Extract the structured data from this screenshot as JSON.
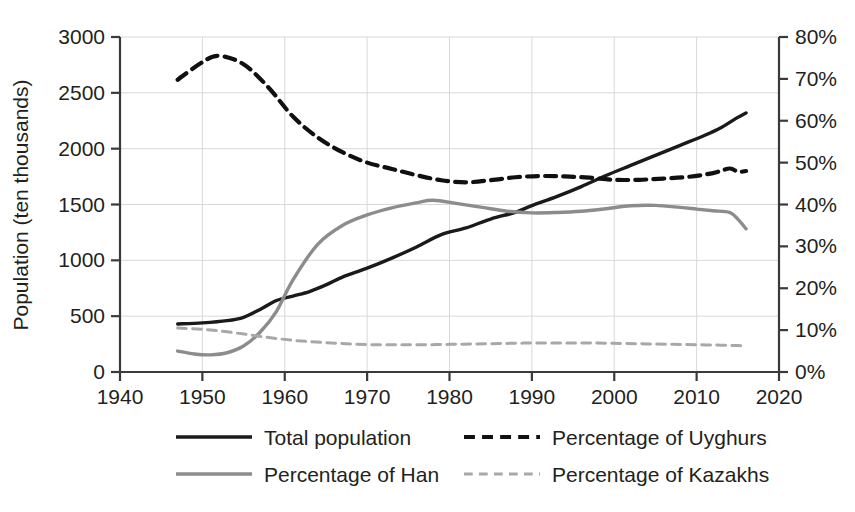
{
  "chart_data": {
    "type": "line",
    "title": "",
    "xlabel": "",
    "ylabel": "Population (ten thousands)",
    "y2label": "",
    "xlim": [
      1940,
      2020
    ],
    "ylim": [
      0,
      3000
    ],
    "y2lim": [
      0,
      80
    ],
    "grid": true,
    "legend_position": "bottom",
    "x_ticks": [
      "1940",
      "1950",
      "1960",
      "1970",
      "1980",
      "1990",
      "2000",
      "2010",
      "2020"
    ],
    "y_ticks": [
      "0",
      "500",
      "1000",
      "1500",
      "2000",
      "2500",
      "3000"
    ],
    "y2_ticks": [
      "0%",
      "10%",
      "20%",
      "30%",
      "40%",
      "50%",
      "60%",
      "70%",
      "80%"
    ],
    "series": [
      {
        "name": "Total population",
        "axis": "left",
        "style": "solid",
        "color": "#1a1a1a",
        "width": 3.4,
        "x": [
          1947,
          1950,
          1953,
          1955,
          1957,
          1959,
          1961,
          1963,
          1965,
          1967,
          1970,
          1973,
          1976,
          1979,
          1982,
          1985,
          1988,
          1990,
          1993,
          1996,
          1999,
          2002,
          2005,
          2008,
          2011,
          2013,
          2015,
          2016
        ],
        "values": [
          430,
          440,
          460,
          490,
          560,
          640,
          680,
          720,
          780,
          850,
          930,
          1020,
          1120,
          1230,
          1290,
          1370,
          1430,
          1490,
          1570,
          1660,
          1760,
          1850,
          1940,
          2030,
          2120,
          2190,
          2280,
          2320
        ]
      },
      {
        "name": "Percentage of Uyghurs",
        "axis": "right",
        "style": "dashed",
        "color": "#101010",
        "width": 4.2,
        "x": [
          1947,
          1950,
          1952,
          1955,
          1958,
          1961,
          1964,
          1967,
          1970,
          1973,
          1976,
          1979,
          1982,
          1985,
          1988,
          1991,
          1994,
          1997,
          2000,
          2003,
          2006,
          2009,
          2012,
          2014,
          2015,
          2016
        ],
        "values": [
          69.8,
          74.0,
          75.5,
          73.5,
          68.0,
          61.0,
          56.0,
          52.5,
          50.0,
          48.5,
          47.0,
          45.8,
          45.3,
          45.8,
          46.5,
          46.8,
          46.7,
          46.4,
          45.9,
          45.9,
          46.2,
          46.6,
          47.5,
          48.6,
          47.8,
          48.0
        ]
      },
      {
        "name": "Percentage of Han",
        "axis": "right",
        "style": "solid",
        "color": "#8c8c8c",
        "width": 3.4,
        "x": [
          1947,
          1949,
          1951,
          1953,
          1955,
          1957,
          1959,
          1961,
          1964,
          1967,
          1970,
          1973,
          1976,
          1978,
          1981,
          1984,
          1987,
          1990,
          1993,
          1996,
          1999,
          2002,
          2005,
          2008,
          2010,
          2012,
          2014,
          2015,
          2016
        ],
        "values": [
          5.0,
          4.3,
          4.1,
          4.6,
          6.2,
          9.5,
          14.5,
          22.0,
          30.5,
          35.0,
          37.5,
          39.2,
          40.4,
          41.0,
          40.2,
          39.3,
          38.4,
          38.0,
          38.1,
          38.4,
          39.0,
          39.7,
          39.8,
          39.3,
          38.9,
          38.5,
          38.1,
          36.5,
          34.2
        ]
      },
      {
        "name": "Percentage of Kazakhs",
        "axis": "right",
        "style": "dashed-light",
        "color": "#a8a8a8",
        "width": 3.0,
        "x": [
          1947,
          1950,
          1953,
          1956,
          1959,
          1962,
          1965,
          1968,
          1971,
          1974,
          1977,
          1980,
          1983,
          1986,
          1989,
          1992,
          1995,
          1998,
          2001,
          2004,
          2007,
          2010,
          2013,
          2015,
          2016
        ],
        "values": [
          10.5,
          10.2,
          9.6,
          8.8,
          8.0,
          7.4,
          7.0,
          6.7,
          6.5,
          6.5,
          6.5,
          6.6,
          6.7,
          6.8,
          6.9,
          6.9,
          6.9,
          6.9,
          6.8,
          6.7,
          6.6,
          6.5,
          6.4,
          6.3,
          6.2
        ]
      }
    ]
  },
  "legend": {
    "items": [
      {
        "label": "Total population",
        "style": "solid",
        "color": "#1a1a1a"
      },
      {
        "label": "Percentage of Uyghurs",
        "style": "dashed",
        "color": "#101010"
      },
      {
        "label": "Percentage of Han",
        "style": "solid",
        "color": "#8c8c8c"
      },
      {
        "label": "Percentage of Kazakhs",
        "style": "dashed-light",
        "color": "#a8a8a8"
      }
    ]
  },
  "axes": {
    "left_title": "Population (ten thousands)"
  }
}
